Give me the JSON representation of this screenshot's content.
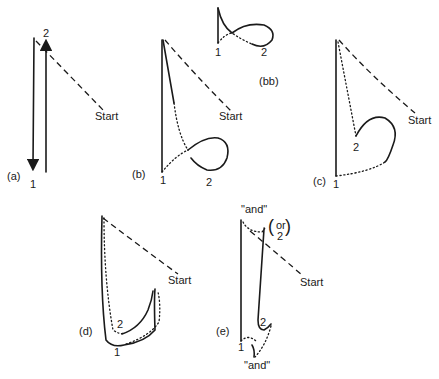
{
  "panels": {
    "a": {
      "label": "(a)",
      "start": "Start",
      "p1": "1",
      "p2": "2"
    },
    "b": {
      "label": "(b)",
      "start": "Start",
      "p1": "1",
      "p2": "2"
    },
    "bb": {
      "label": "(bb)",
      "p1": "1",
      "p2": "2"
    },
    "c": {
      "label": "(c)",
      "start": "Start",
      "p1": "1",
      "p2": "2"
    },
    "d": {
      "label": "(d)",
      "start": "Start",
      "p1": "1",
      "p2": "2"
    },
    "e": {
      "label": "(e)",
      "start": "Start",
      "p1": "1",
      "p2": "2",
      "and_top": "\"and\"",
      "and_bottom": "\"and\"",
      "or_word": "or",
      "or_num": "2"
    }
  }
}
